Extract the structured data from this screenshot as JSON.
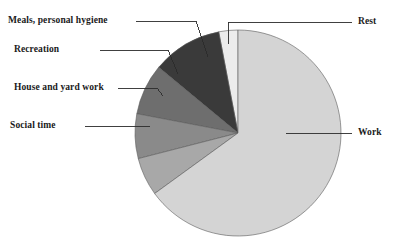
{
  "chart_data": {
    "type": "pie",
    "title": "",
    "subtitle": "",
    "xlabel": "",
    "ylabel": "",
    "legend_position": "none",
    "grid": false,
    "labels_placement": "outside-with-leader-lines",
    "start_angle_deg": 0,
    "direction": "counterclockwise",
    "categories": [
      "Rest",
      "Meals, personal hygiene",
      "Recreation",
      "House and yard work",
      "Social time",
      "Work"
    ],
    "values": [
      3,
      11,
      8,
      7,
      6,
      65
    ],
    "units": "percent",
    "slices": [
      {
        "label": "Rest",
        "value": 3,
        "color": "#ececec",
        "side": "right"
      },
      {
        "label": "Meals, personal hygiene",
        "value": 11,
        "color": "#3a3a3a",
        "side": "left"
      },
      {
        "label": "Recreation",
        "value": 8,
        "color": "#6e6e6e",
        "side": "left"
      },
      {
        "label": "House and yard work",
        "value": 7,
        "color": "#8a8a8a",
        "side": "left"
      },
      {
        "label": "Social time",
        "value": 6,
        "color": "#a8a8a8",
        "side": "left"
      },
      {
        "label": "Work",
        "value": 65,
        "color": "#d4d4d4",
        "side": "right"
      }
    ]
  },
  "labels": {
    "meals": "Meals, personal hygiene",
    "recreation": "Recreation",
    "house": "House and yard work",
    "social": "Social time",
    "rest": "Rest",
    "work": "Work"
  },
  "colors": {
    "background": "#ffffff",
    "outline": "#5a5a5a",
    "leader": "#2b2b2b",
    "text": "#1a1a1a",
    "rest": "#ececec",
    "meals": "#3a3a3a",
    "recreation": "#6e6e6e",
    "house": "#8a8a8a",
    "social": "#a8a8a8",
    "work": "#d4d4d4"
  }
}
